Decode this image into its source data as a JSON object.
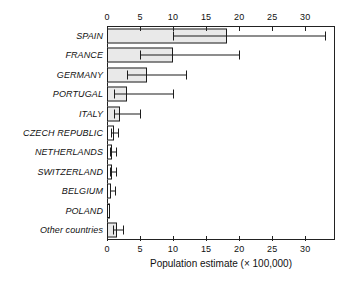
{
  "chart_data": {
    "type": "bar",
    "orientation": "horizontal",
    "title": "",
    "xlabel": "Population estimate (× 100,000)",
    "ylabel": "",
    "xlim": [
      0,
      34.5
    ],
    "xticks": [
      0,
      5,
      10,
      15,
      20,
      25,
      30
    ],
    "xtick_labels": [
      "0",
      "5",
      "10",
      "15",
      "20",
      "25",
      "30"
    ],
    "grid": false,
    "legend": null,
    "axis_positions": [
      "top",
      "bottom"
    ],
    "bar_fill_color": "#e9e9e9",
    "bar_edge_color": "#1c1c1c",
    "categories": [
      "SPAIN",
      "FRANCE",
      "GERMANY",
      "PORTUGAL",
      "ITALY",
      "CZECH REPUBLIC",
      "NETHERLANDS",
      "SWITZERLAND",
      "BELGIUM",
      "POLAND",
      "Other countries"
    ],
    "values": [
      18.2,
      10.0,
      6.0,
      3.0,
      2.0,
      1.0,
      0.8,
      0.7,
      0.6,
      0.5,
      1.5
    ],
    "error_low": [
      10.0,
      5.0,
      3.0,
      1.0,
      1.0,
      0.6,
      0.5,
      0.4,
      0.4,
      null,
      0.9
    ],
    "error_high": [
      33.0,
      20.0,
      12.0,
      10.0,
      5.0,
      1.7,
      1.4,
      1.3,
      1.2,
      null,
      2.4
    ],
    "series": [
      {
        "name": "Population estimate",
        "values": [
          18.2,
          10.0,
          6.0,
          3.0,
          2.0,
          1.0,
          0.8,
          0.7,
          0.6,
          0.5,
          1.5
        ]
      }
    ]
  }
}
